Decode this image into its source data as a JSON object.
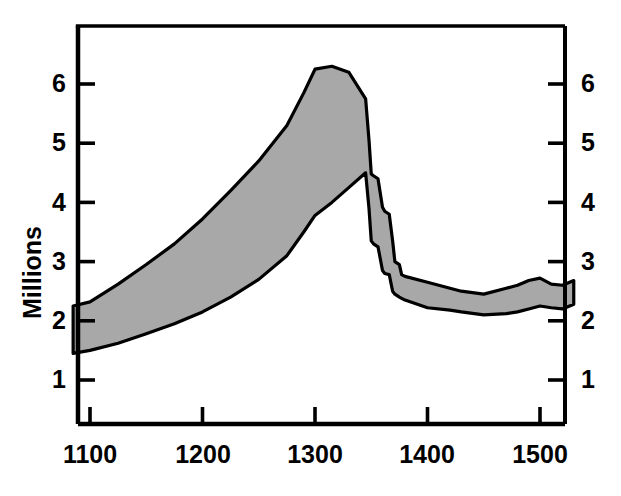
{
  "figure": {
    "background_color": "#ffffff",
    "axis_color": "#000000",
    "band_fill_color": "#a8a8a8",
    "band_stroke_color": "#000000"
  },
  "axes": {
    "y_axis_title": "Millions",
    "y_ticks_left": [
      "1",
      "2",
      "3",
      "4",
      "5",
      "6"
    ],
    "y_ticks_right": [
      "1",
      "2",
      "3",
      "4",
      "5",
      "6"
    ],
    "x_ticks": [
      "1100",
      "1200",
      "1300",
      "1400",
      "1500"
    ]
  },
  "chart_data": {
    "type": "area",
    "title": "",
    "subtitle": "",
    "xlabel": "",
    "ylabel": "Millions",
    "xlim": [
      1085,
      1530
    ],
    "ylim": [
      0,
      7.0
    ],
    "grid": false,
    "legend_position": "none",
    "annotations": [],
    "x_tick_values": [
      1100,
      1200,
      1300,
      1400,
      1500
    ],
    "x_tick_labels": [
      "1100",
      "1200",
      "1300",
      "1400",
      "1500"
    ],
    "y_tick_values": [
      1,
      2,
      3,
      4,
      5,
      6
    ],
    "y_tick_labels": [
      "1",
      "2",
      "3",
      "4",
      "5",
      "6"
    ],
    "y_axis_right_mirrored": true,
    "x": [
      1085,
      1100,
      1125,
      1150,
      1175,
      1200,
      1225,
      1250,
      1275,
      1290,
      1300,
      1315,
      1330,
      1345,
      1348,
      1350,
      1352,
      1356,
      1360,
      1362,
      1366,
      1369,
      1371,
      1375,
      1377,
      1380,
      1400,
      1420,
      1430,
      1450,
      1470,
      1480,
      1490,
      1500,
      1510,
      1520,
      1530
    ],
    "series": [
      {
        "name": "High estimate",
        "values": [
          2.25,
          2.32,
          2.62,
          2.95,
          3.3,
          3.72,
          4.2,
          4.7,
          5.3,
          5.85,
          6.25,
          6.3,
          6.2,
          5.75,
          5.05,
          4.48,
          4.45,
          4.4,
          3.92,
          3.85,
          3.8,
          3.35,
          3.0,
          2.95,
          2.78,
          2.75,
          2.65,
          2.55,
          2.5,
          2.45,
          2.55,
          2.6,
          2.68,
          2.72,
          2.62,
          2.6,
          2.68
        ]
      },
      {
        "name": "Low estimate",
        "values": [
          1.45,
          1.5,
          1.62,
          1.78,
          1.95,
          2.15,
          2.4,
          2.7,
          3.1,
          3.5,
          3.78,
          4.0,
          4.25,
          4.5,
          3.9,
          3.35,
          3.3,
          3.25,
          2.85,
          2.8,
          2.78,
          2.5,
          2.45,
          2.4,
          2.38,
          2.35,
          2.22,
          2.18,
          2.15,
          2.1,
          2.12,
          2.15,
          2.2,
          2.25,
          2.22,
          2.2,
          2.28
        ]
      }
    ]
  }
}
